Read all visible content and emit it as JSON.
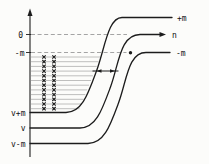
{
  "diagram": {
    "type": "energy-level-diagram",
    "left_labels": {
      "zero": "0",
      "minus_m": "-m",
      "v_plus_m": "v+m",
      "v": "v",
      "v_minus_m": "v-m"
    },
    "right_labels": {
      "plus_m": "+m",
      "n": "n",
      "minus_m": "-m"
    },
    "levels": {
      "count": 12,
      "y_start": 57,
      "y_step": 4.7,
      "x_left": 30.5,
      "x_end_start": 100.5,
      "x_end_step": -1.9,
      "marker_columns": [
        44,
        54
      ],
      "marker_size": 1.7,
      "marker_symbol": "x-cross"
    },
    "colors": {
      "background": "#fcfcfa",
      "curve": "#1c1c1c",
      "dashed": "#9a9a9a",
      "level_line": "#8c8c8c",
      "marker": "#1c1c1c",
      "label": "#111111"
    }
  }
}
